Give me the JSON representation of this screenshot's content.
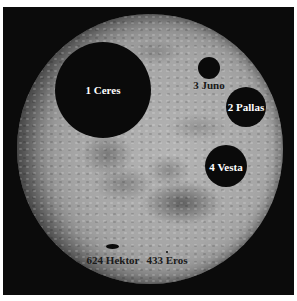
{
  "image": {
    "subject": "Asteroid size comparison overlaid on the Moon",
    "background_color": "#0b0b0b",
    "moon_color": "#a6a6a6",
    "asteroid_color": "#0a0a0a"
  },
  "asteroids": [
    {
      "label": "1 Ceres",
      "cx": 103,
      "cy": 90,
      "rx": 48,
      "ry": 48,
      "label_x": 103,
      "label_y": 90,
      "label_style": "light"
    },
    {
      "label": "3 Juno",
      "cx": 209,
      "cy": 68,
      "rx": 11,
      "ry": 11,
      "label_x": 209,
      "label_y": 85,
      "label_style": "dark"
    },
    {
      "label": "2 Pallas",
      "cx": 246,
      "cy": 107,
      "rx": 20,
      "ry": 20,
      "label_x": 246,
      "label_y": 107,
      "label_style": "light"
    },
    {
      "label": "4 Vesta",
      "cx": 226,
      "cy": 166,
      "rx": 21,
      "ry": 21,
      "label_x": 226,
      "label_y": 167,
      "label_style": "light"
    },
    {
      "label": "624 Hektor",
      "cx": 113,
      "cy": 247,
      "rx": 6.5,
      "ry": 2.5,
      "label_x": 113,
      "label_y": 260,
      "label_style": "dark"
    },
    {
      "label": "433 Eros",
      "cx": 167,
      "cy": 252,
      "rx": 1,
      "ry": 1,
      "label_x": 167,
      "label_y": 260,
      "label_style": "dark"
    }
  ]
}
